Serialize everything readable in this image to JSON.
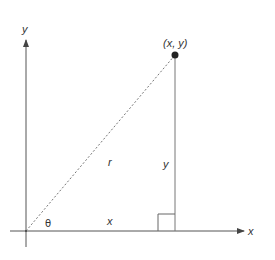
{
  "diagram": {
    "axes": {
      "x_label": "x",
      "y_label": "y"
    },
    "point": {
      "label": "(x, y)"
    },
    "segments": {
      "hypotenuse_label": "r",
      "vertical_leg_label": "y",
      "horizontal_leg_label": "x"
    },
    "angle": {
      "label": "θ"
    },
    "colors": {
      "axis": "#555555",
      "line": "#777777",
      "dashed": "#777777",
      "point": "#222222",
      "text": "#333333"
    }
  }
}
